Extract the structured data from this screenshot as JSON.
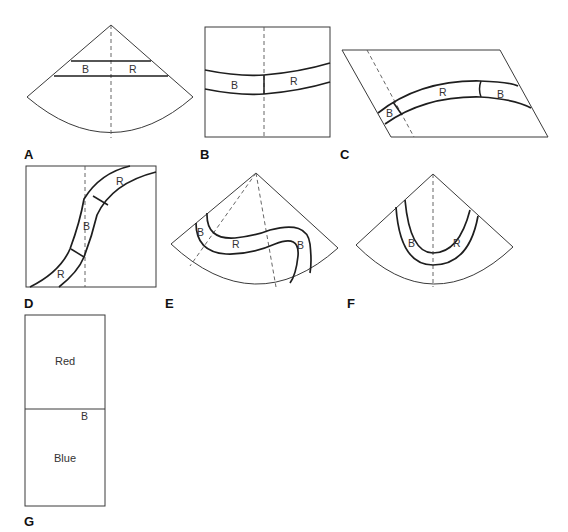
{
  "figure": {
    "panels": [
      {
        "id": "A",
        "label": "A",
        "shape": "sector",
        "layers": [
          "B",
          "R"
        ]
      },
      {
        "id": "B",
        "label": "B",
        "shape": "square",
        "layers": [
          "B",
          "R"
        ]
      },
      {
        "id": "C",
        "label": "C",
        "shape": "parallelogram",
        "layers": [
          "B",
          "R",
          "B"
        ]
      },
      {
        "id": "D",
        "label": "D",
        "shape": "square",
        "layers": [
          "R",
          "B",
          "R"
        ]
      },
      {
        "id": "E",
        "label": "E",
        "shape": "sector",
        "layers": [
          "B",
          "R",
          "B"
        ]
      },
      {
        "id": "F",
        "label": "F",
        "shape": "sector",
        "layers": [
          "B",
          "R"
        ]
      },
      {
        "id": "G",
        "label": "G",
        "shape": "rectangle",
        "regions": [
          "Red",
          "Blue"
        ],
        "boundary_label": "B"
      }
    ],
    "layer_labels": {
      "A": {
        "left": "B",
        "right": "R"
      },
      "B": {
        "left": "B",
        "right": "R"
      },
      "C": {
        "left": "B",
        "middle": "R",
        "right": "B"
      },
      "D": {
        "top": "R",
        "middle": "B",
        "bottom": "R"
      },
      "E": {
        "left": "B",
        "middle": "R",
        "right": "B"
      },
      "F": {
        "left": "B",
        "right": "R"
      },
      "G": {
        "top": "Red",
        "bottom": "Blue",
        "boundary": "B"
      }
    }
  }
}
